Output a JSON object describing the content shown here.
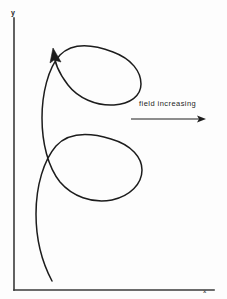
{
  "figure": {
    "background_color": "#fdfdfd",
    "ink_color": "#1c1c1c",
    "axes": {
      "y_label": "y",
      "x_label": "x",
      "origin": {
        "x": 14,
        "y": 290
      },
      "y_axis_top": {
        "x": 14,
        "y": 18
      },
      "x_axis_right": {
        "x": 214,
        "y": 290
      },
      "line_color": "#3a3a3a",
      "line_width": 1.6
    },
    "annotation": {
      "text": "field increasing",
      "arrow": {
        "from": {
          "x": 131,
          "y": 119
        },
        "to": {
          "x": 206,
          "y": 119
        },
        "direction": "right",
        "color": "#1e1e1e"
      }
    },
    "direction_arrowhead": {
      "at": {
        "x": 55,
        "y": 51
      },
      "points": "up-left",
      "color": "#1c1c1c"
    }
  },
  "chart_data": {
    "type": "line",
    "title": "",
    "subtitle": "",
    "xlabel": "x",
    "ylabel": "y",
    "grid": false,
    "legend": null,
    "annotations": [
      {
        "text": "field increasing",
        "x": 139,
        "y": 104,
        "arrow_from_x": 131,
        "arrow_from_y": 119,
        "arrow_to_x": 206,
        "arrow_to_y": 119
      }
    ],
    "series": [
      {
        "name": "trochoidal particle trajectory",
        "description": "Looping cycloid-like drift path with three successive loops of decreasing size toward the bottom; travel direction is upward as indicated by the arrowhead.",
        "color": "#1c1c1c",
        "linewidth": 1.5,
        "loop_count": 3,
        "loops": [
          {
            "index": 1,
            "position": "top",
            "cx": 99,
            "cy": 77,
            "rx": 42,
            "ry": 29,
            "x_range": [
              56,
              141
            ],
            "y_range": [
              48,
              106
            ]
          },
          {
            "index": 2,
            "position": "middle",
            "cx": 99,
            "cy": 168,
            "rx": 43,
            "ry": 33,
            "x_range": [
              56,
              142
            ],
            "y_range": [
              135,
              201
            ]
          },
          {
            "index": 3,
            "position": "bottom",
            "cx": 101,
            "cy": 258,
            "rx": 42,
            "ry": 28,
            "x_range": [
              59,
              143
            ],
            "y_range": [
              230,
              286
            ]
          }
        ],
        "path": "M 52,281 C 44,266 36,243 36,214 C 36,185 44,160 56,146 C 68,133 88,132 111,139 C 132,145 142,158 142,170 C 142,184 130,196 112,200 C 92,204 72,196 60,182 C 48,167 42,143 42,118 C 42,94 48,68 60,55 C 72,43 92,44 113,52 C 132,59 141,72 141,84 C 141,96 130,104 114,105 C 96,106 78,98 68,85 C 58,72 54,60 54,52"
      }
    ]
  }
}
